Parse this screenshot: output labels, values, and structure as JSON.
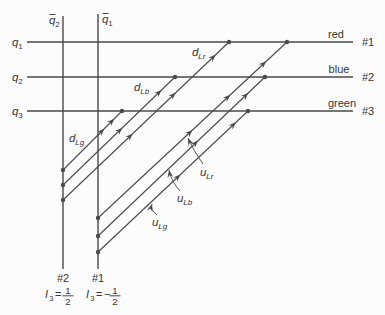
{
  "figure": {
    "background": "#fcfcfc",
    "ink_color": "#4a4a4a",
    "text_color": "#353535",
    "width": 385,
    "height": 315,
    "color_lines": [
      {
        "id": "q1",
        "y": 42,
        "x1": 27,
        "x2": 353,
        "label": {
          "base": "q",
          "sub": "1"
        },
        "label_pos": [
          12,
          46
        ],
        "color_name": "red",
        "color_pos": [
          336,
          38
        ],
        "line_number": "#1",
        "number_pos": [
          362,
          46
        ]
      },
      {
        "id": "q2",
        "y": 77,
        "x1": 27,
        "x2": 353,
        "label": {
          "base": "q",
          "sub": "2"
        },
        "label_pos": [
          12,
          81
        ],
        "color_name": "blue",
        "color_pos": [
          339,
          73
        ],
        "line_number": "#2",
        "number_pos": [
          362,
          81
        ]
      },
      {
        "id": "q3",
        "y": 111,
        "x1": 27,
        "x2": 353,
        "label": {
          "base": "q",
          "sub": "3"
        },
        "label_pos": [
          12,
          115
        ],
        "color_name": "green",
        "color_pos": [
          342,
          107
        ],
        "line_number": "#3",
        "number_pos": [
          362,
          115
        ]
      }
    ],
    "antiquark_lines": [
      {
        "id": "qbar2",
        "x": 63,
        "y1": 16,
        "y2": 269,
        "label": {
          "base": "q",
          "bar": true,
          "sub": "2"
        },
        "label_pos": [
          49,
          24
        ],
        "line_number": "#2",
        "number_pos": [
          63,
          282
        ],
        "isospin": {
          "base": "I",
          "sub": "3",
          "rel": "=",
          "sign": "",
          "num": "1",
          "den": "2"
        },
        "isospin_pos": [
          45,
          298
        ]
      },
      {
        "id": "qbar1",
        "x": 98,
        "y1": 14,
        "y2": 269,
        "label": {
          "base": "q",
          "bar": true,
          "sub": "1"
        },
        "label_pos": [
          102,
          23
        ],
        "line_number": "#1",
        "number_pos": [
          98,
          282
        ],
        "isospin": {
          "base": "I",
          "sub": "3",
          "rel": "=",
          "sign": "−",
          "num": "1",
          "den": "2"
        },
        "isospin_pos": [
          86,
          298
        ]
      }
    ],
    "quark_diagonals": [
      {
        "id": "dLg",
        "from": [
          63,
          170
        ],
        "to": [
          122,
          111
        ],
        "arrows": [
          0.7,
          0.87
        ],
        "label": {
          "base": "d",
          "sub": "Lg"
        },
        "label_pos": [
          69,
          142
        ]
      },
      {
        "id": "dLb",
        "from": [
          63,
          185
        ],
        "to": [
          175,
          77
        ],
        "arrows": [
          0.53,
          0.88
        ],
        "label": {
          "base": "d",
          "sub": "Lb"
        },
        "label_pos": [
          134,
          91
        ]
      },
      {
        "id": "dLr",
        "from": [
          63,
          200
        ],
        "to": [
          229,
          42
        ],
        "arrows": [
          0.42,
          0.68,
          0.92
        ],
        "label": {
          "base": "d",
          "sub": "Lr"
        },
        "label_pos": [
          192,
          56
        ]
      },
      {
        "id": "uLg",
        "from": [
          98,
          252
        ],
        "to": [
          248,
          111
        ],
        "arrows": [
          0.55,
          0.92
        ],
        "label": {
          "base": "u",
          "sub": "Lg"
        },
        "label_pos": [
          152,
          226
        ],
        "leader": {
          "from": [
            157,
            215
          ],
          "ctrl": [
            150,
            210
          ],
          "tip": [
            152,
            204
          ]
        }
      },
      {
        "id": "uLb",
        "from": [
          98,
          236
        ],
        "to": [
          265,
          77
        ],
        "arrows": [
          0.6,
          0.9
        ],
        "label": {
          "base": "u",
          "sub": "Lb"
        },
        "label_pos": [
          177,
          202
        ],
        "leader": {
          "from": [
            180,
            191
          ],
          "ctrl": [
            171,
            181
          ],
          "tip": [
            169,
            170
          ]
        }
      },
      {
        "id": "uLr",
        "from": [
          98,
          218
        ],
        "to": [
          287,
          42
        ],
        "arrows": [
          0.5,
          0.7,
          0.89
        ],
        "label": {
          "base": "u",
          "sub": "Lr"
        },
        "label_pos": [
          200,
          176
        ],
        "leader": {
          "from": [
            203,
            164
          ],
          "ctrl": [
            193,
            150
          ],
          "tip": [
            188,
            138
          ]
        }
      }
    ]
  }
}
